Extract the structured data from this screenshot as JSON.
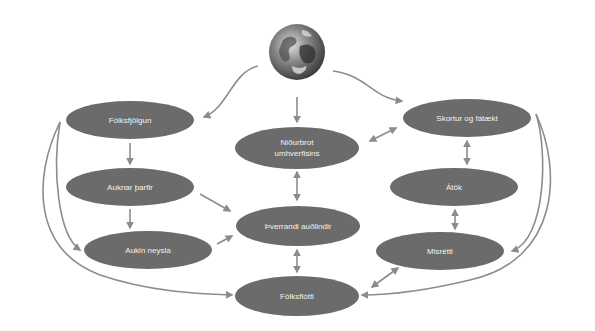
{
  "diagram": {
    "type": "cause-effect cycle",
    "center_icon": "globe-icon",
    "colors": {
      "node_fill": "#6b6b6b",
      "node_text": "#f2f2f2",
      "arrow": "#8c8c8c",
      "background": "#ffffff"
    },
    "nodes": [
      {
        "id": "folksfjolgun",
        "label": "Fólksfjölgun",
        "cx": 130,
        "cy": 120
      },
      {
        "id": "auknar_tharfir",
        "label": "Auknar þarfir",
        "cx": 130,
        "cy": 187
      },
      {
        "id": "aukin_neysla",
        "label": "Aukin neysla",
        "cx": 148,
        "cy": 250
      },
      {
        "id": "nidurbrot",
        "label": "Niðurbrot",
        "label2": "umhverfisins",
        "cx": 297,
        "cy": 148
      },
      {
        "id": "thverrandi",
        "label": "Þverrandi auðlindir",
        "cx": 300,
        "cy": 226
      },
      {
        "id": "folksflotti",
        "label": "Fólksflótti",
        "cx": 297,
        "cy": 296
      },
      {
        "id": "skortur",
        "label": "Skortur og fátækt",
        "cx": 467,
        "cy": 118
      },
      {
        "id": "atok",
        "label": "Átök",
        "cx": 453,
        "cy": 187
      },
      {
        "id": "misretti",
        "label": "Misrétti",
        "cx": 440,
        "cy": 251
      }
    ],
    "edges": [
      {
        "from": "globe",
        "to": "folksfjolgun",
        "type": "one-way"
      },
      {
        "from": "globe",
        "to": "nidurbrot",
        "type": "one-way"
      },
      {
        "from": "globe",
        "to": "skortur",
        "type": "one-way"
      },
      {
        "from": "folksfjolgun",
        "to": "auknar_tharfir",
        "type": "one-way"
      },
      {
        "from": "auknar_tharfir",
        "to": "aukin_neysla",
        "type": "one-way"
      },
      {
        "from": "auknar_tharfir",
        "to": "thverrandi",
        "type": "one-way"
      },
      {
        "from": "aukin_neysla",
        "to": "thverrandi",
        "type": "one-way"
      },
      {
        "from": "folksfjolgun",
        "to": "aukin_neysla",
        "type": "one-way"
      },
      {
        "from": "folksfjolgun",
        "to": "folksflotti",
        "type": "one-way"
      },
      {
        "from": "nidurbrot",
        "to": "thverrandi",
        "type": "two-way"
      },
      {
        "from": "thverrandi",
        "to": "folksflotti",
        "type": "two-way"
      },
      {
        "from": "nidurbrot",
        "to": "skortur",
        "type": "two-way"
      },
      {
        "from": "skortur",
        "to": "atok",
        "type": "two-way"
      },
      {
        "from": "atok",
        "to": "misretti",
        "type": "two-way"
      },
      {
        "from": "misretti",
        "to": "folksflotti",
        "type": "two-way"
      },
      {
        "from": "skortur",
        "to": "misretti",
        "type": "one-way"
      },
      {
        "from": "skortur",
        "to": "folksflotti",
        "type": "one-way"
      }
    ]
  }
}
